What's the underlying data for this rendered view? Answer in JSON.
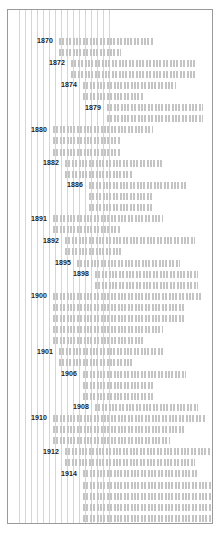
{
  "chart_data": {
    "type": "bar",
    "orientation": "horizontal",
    "title": "",
    "subtitle": "",
    "xlabel": "",
    "ylabel": "",
    "grid": true,
    "gridlines_vertical": true,
    "legend": "none",
    "axis_note": "Horizontal dotted bars (Gantt/timeline style). Each labelled year heads a group of one or more bars; bars begin at the label's anchor column and extend rightward by varying lengths. Units are pixel-derived spans of the plot width.",
    "xlim": [
      0,
      206
    ],
    "gridline_positions": [
      11,
      17,
      23,
      29,
      35,
      41,
      47,
      53,
      59,
      65,
      71,
      77,
      83,
      89,
      95,
      101
    ],
    "categories": [
      "1870",
      "1872",
      "1874",
      "1879",
      "1880",
      "1882",
      "1886",
      "1891",
      "1892",
      "1895",
      "1898",
      "1900",
      "1901",
      "1906",
      "1908",
      "1910",
      "1912",
      "1914"
    ],
    "groups": [
      {
        "label": "1870",
        "label_right_px": 45,
        "bars": [
          {
            "start": 51,
            "end": 145
          },
          {
            "start": 51,
            "end": 113
          }
        ]
      },
      {
        "label": "1872",
        "label_right_px": 57,
        "bars": [
          {
            "start": 63,
            "end": 187
          },
          {
            "start": 63,
            "end": 187
          }
        ]
      },
      {
        "label": "1874",
        "label_right_px": 69,
        "bars": [
          {
            "start": 75,
            "end": 168
          },
          {
            "start": 75,
            "end": 136
          }
        ]
      },
      {
        "label": "1879",
        "label_right_px": 93,
        "bars": [
          {
            "start": 99,
            "end": 195
          },
          {
            "start": 99,
            "end": 195
          }
        ]
      },
      {
        "label": "1880",
        "label_right_px": 39,
        "bars": [
          {
            "start": 45,
            "end": 145
          },
          {
            "start": 45,
            "end": 113
          },
          {
            "start": 45,
            "end": 113
          }
        ]
      },
      {
        "label": "1882",
        "label_right_px": 51,
        "bars": [
          {
            "start": 57,
            "end": 155
          },
          {
            "start": 57,
            "end": 124
          }
        ]
      },
      {
        "label": "1886",
        "label_right_px": 75,
        "bars": [
          {
            "start": 81,
            "end": 178
          },
          {
            "start": 81,
            "end": 145
          },
          {
            "start": 81,
            "end": 145
          }
        ]
      },
      {
        "label": "1891",
        "label_right_px": 39,
        "bars": [
          {
            "start": 45,
            "end": 155
          },
          {
            "start": 45,
            "end": 113
          }
        ]
      },
      {
        "label": "1892",
        "label_right_px": 51,
        "bars": [
          {
            "start": 57,
            "end": 187
          },
          {
            "start": 57,
            "end": 113
          }
        ]
      },
      {
        "label": "1895",
        "label_right_px": 63,
        "bars": [
          {
            "start": 69,
            "end": 172
          }
        ]
      },
      {
        "label": "1898",
        "label_right_px": 81,
        "bars": [
          {
            "start": 87,
            "end": 190
          },
          {
            "start": 87,
            "end": 190
          }
        ]
      },
      {
        "label": "1900",
        "label_right_px": 39,
        "bars": [
          {
            "start": 45,
            "end": 195
          },
          {
            "start": 45,
            "end": 178
          },
          {
            "start": 45,
            "end": 178
          },
          {
            "start": 45,
            "end": 155
          },
          {
            "start": 45,
            "end": 136
          }
        ]
      },
      {
        "label": "1901",
        "label_right_px": 45,
        "bars": [
          {
            "start": 51,
            "end": 155
          },
          {
            "start": 51,
            "end": 124
          }
        ]
      },
      {
        "label": "1906",
        "label_right_px": 69,
        "bars": [
          {
            "start": 75,
            "end": 178
          },
          {
            "start": 75,
            "end": 145
          },
          {
            "start": 75,
            "end": 145
          }
        ]
      },
      {
        "label": "1908",
        "label_right_px": 81,
        "bars": [
          {
            "start": 87,
            "end": 190
          }
        ]
      },
      {
        "label": "1910",
        "label_right_px": 39,
        "bars": [
          {
            "start": 45,
            "end": 198
          },
          {
            "start": 45,
            "end": 178
          },
          {
            "start": 45,
            "end": 162
          }
        ]
      },
      {
        "label": "1912",
        "label_right_px": 51,
        "bars": [
          {
            "start": 57,
            "end": 203
          },
          {
            "start": 57,
            "end": 187
          }
        ]
      },
      {
        "label": "1914",
        "label_right_px": 69,
        "bars": [
          {
            "start": 75,
            "end": 190
          },
          {
            "start": 75,
            "end": 203
          },
          {
            "start": 75,
            "end": 203
          },
          {
            "start": 75,
            "end": 203
          },
          {
            "start": 75,
            "end": 203
          },
          {
            "start": 75,
            "end": 203
          }
        ]
      }
    ]
  },
  "style": {
    "frame_border_color": "#9a9a9a",
    "gridline_color": "#d6d6d6",
    "bar_color": "#c4c4c4",
    "label_color": "#1c1c1c",
    "background_color": "#ffffff"
  },
  "layout": {
    "row_start_y": 26,
    "row_pitch": 11.1
  }
}
